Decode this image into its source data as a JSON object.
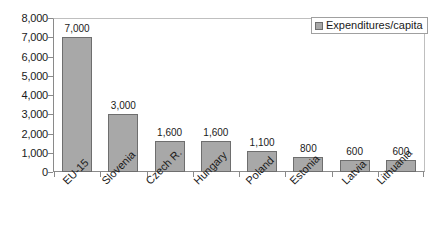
{
  "chart_data": {
    "type": "bar",
    "title": "",
    "subtitle": "",
    "xlabel": "",
    "ylabel": "",
    "categories": [
      "EU-15",
      "Slovenia",
      "Czech R.",
      "Hungary",
      "Poland",
      "Estonia",
      "Latvia",
      "Lithuania"
    ],
    "values": [
      7000,
      3000,
      1600,
      1600,
      1100,
      800,
      600,
      600
    ],
    "data_labels": [
      "7,000",
      "3,000",
      "1,600",
      "1,600",
      "1,100",
      "800",
      "600",
      "600"
    ],
    "series": [
      {
        "name": "Expenditures/capita",
        "values": [
          7000,
          3000,
          1600,
          1600,
          1100,
          800,
          600,
          600
        ]
      }
    ],
    "ylim": [
      0,
      8000
    ],
    "ytick_step": 1000,
    "ytick_labels": [
      "8,000",
      "7,000",
      "6,000",
      "5,000",
      "4,000",
      "3,000",
      "2,000",
      "1,000",
      "0"
    ],
    "ytick_values": [
      8000,
      7000,
      6000,
      5000,
      4000,
      3000,
      2000,
      1000,
      0
    ],
    "grid": false,
    "legend_position": "top-right",
    "xtick_label_rotation": -45,
    "colors": {
      "bar_fill": "#a8a8a8",
      "bar_border": "#6e6e6e",
      "axis": "#8a8a8a",
      "plot_border": "#bfbfbf",
      "text": "#1a1a1a",
      "background": "#ffffff"
    }
  },
  "legend": {
    "entries": [
      {
        "label": "Expenditures/capita",
        "swatch_name": "legend-swatch-expenditures"
      }
    ]
  }
}
